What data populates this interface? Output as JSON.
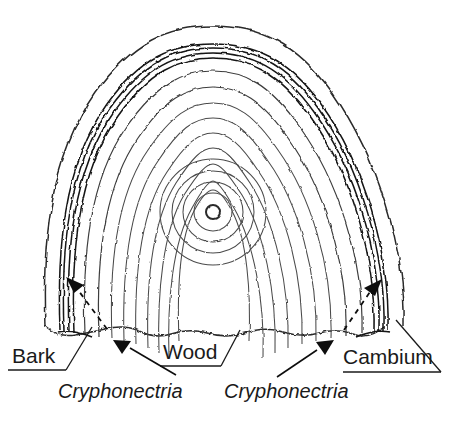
{
  "diagram": {
    "labels": {
      "bark": "Bark",
      "wood": "Wood",
      "cambium": "Cambium",
      "pathogen_left": "Cryphonectria",
      "pathogen_right": "Cryphonectria"
    },
    "colors": {
      "background": "#ffffff",
      "ring_stroke": "#4a4a4a",
      "bark_stroke": "#2b2b2b",
      "cambium_stroke": "#141414",
      "label_text": "#1a1a1a",
      "arrow": "#0d0d0d"
    },
    "structure": {
      "pith_center_x": 212,
      "pith_center_y": 212,
      "pith_radius": 6,
      "growth_ring_count": 13,
      "cambium_band_line_count": 4,
      "bark_outline": "wavy",
      "bottom_edge": "scalloped"
    },
    "annotations": [
      {
        "name": "bark-callout",
        "label": "Bark",
        "style": "solid-leader"
      },
      {
        "name": "wood-callout",
        "label": "Wood",
        "style": "solid-leader"
      },
      {
        "name": "cambium-callout",
        "label": "Cambium",
        "style": "solid-leader"
      },
      {
        "name": "cryphonectria-left-callout",
        "label": "Cryphonectria",
        "style": "solid-arrow"
      },
      {
        "name": "cryphonectria-right-callout",
        "label": "Cryphonectria",
        "style": "solid-arrow"
      },
      {
        "name": "infection-spread-left",
        "label": "",
        "style": "dashed-arrow"
      },
      {
        "name": "infection-spread-right",
        "label": "",
        "style": "dashed-arrow"
      }
    ]
  }
}
